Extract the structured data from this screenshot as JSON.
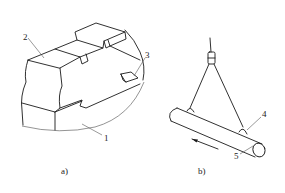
{
  "figure": {
    "subfigures": [
      {
        "id": "a",
        "caption": "a)",
        "description": "Stepped block workpiece resting on a curved support with a small wedge insert",
        "callouts": [
          {
            "number": "1",
            "target": "curved-support-surface"
          },
          {
            "number": "2",
            "target": "stepped-block"
          },
          {
            "number": "3",
            "target": "wedge-insert"
          }
        ]
      },
      {
        "id": "b",
        "caption": "b)",
        "description": "Cylindrical bar suspended by two slings from a hook, with direction arrow",
        "callouts": [
          {
            "number": "4",
            "target": "sling-attachment-lug"
          },
          {
            "number": "5",
            "target": "cylindrical-bar"
          }
        ]
      }
    ],
    "colors": {
      "line": "#1a1a1a",
      "leader": "#555555",
      "background": "#ffffff"
    }
  }
}
